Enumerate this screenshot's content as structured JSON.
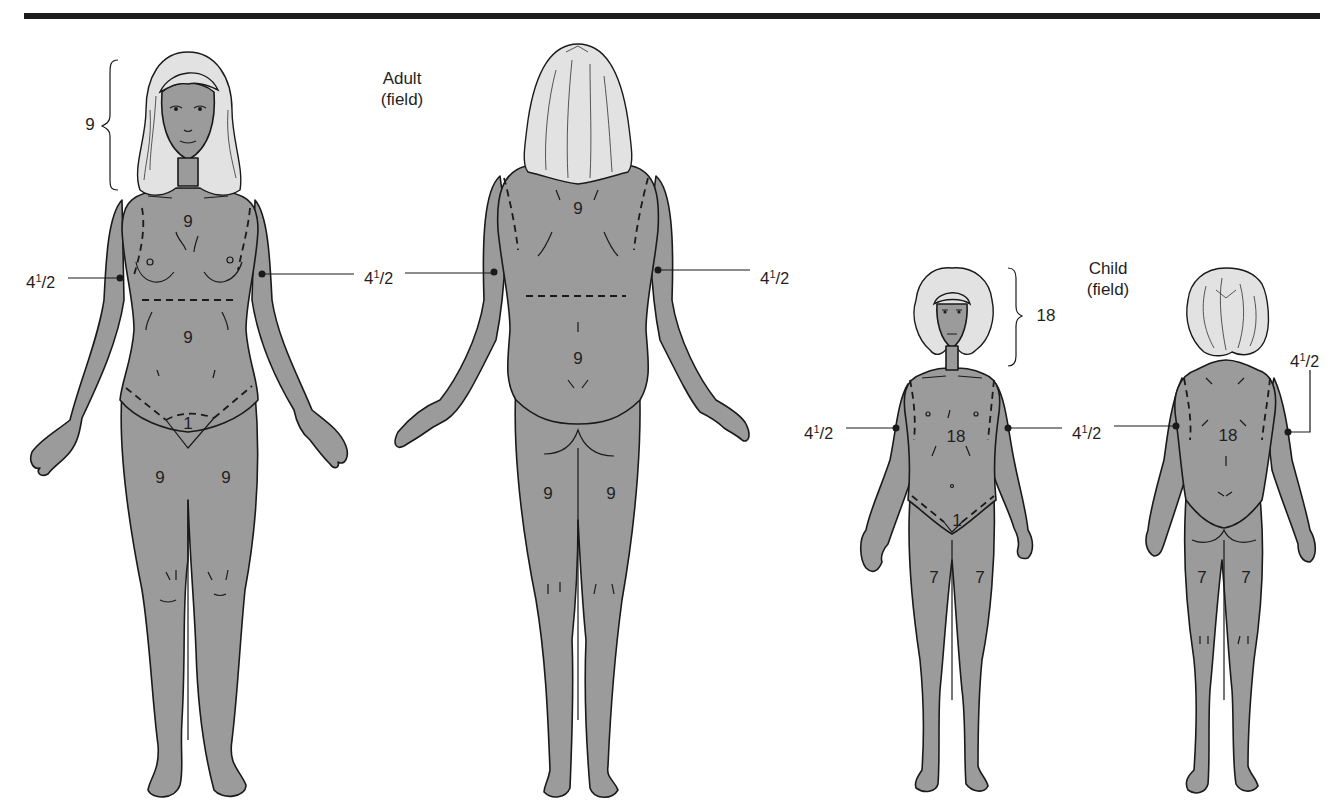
{
  "figure": {
    "colors": {
      "skin": "#9b9b9b",
      "hair": "#e2e2e2",
      "outline": "#1a1a1a",
      "bar": "#1c1c1c"
    },
    "adult": {
      "heading_line1": "Adult",
      "heading_line2": "(field)",
      "front": {
        "head": "9",
        "chest": "9",
        "abdomen": "9",
        "genitalia": "1",
        "left_leg": "9",
        "right_leg": "9",
        "left_arm": {
          "whole": "4",
          "num": "1",
          "den": "2"
        },
        "right_arm": {
          "whole": "4",
          "num": "1",
          "den": "2"
        }
      },
      "back": {
        "upper_back": "9",
        "lower_back": "9",
        "left_leg": "9",
        "right_leg": "9",
        "left_arm": {
          "whole": "4",
          "num": "1",
          "den": "2"
        },
        "right_arm": {
          "whole": "4",
          "num": "1",
          "den": "2"
        }
      }
    },
    "child": {
      "heading_line1": "Child",
      "heading_line2": "(field)",
      "front": {
        "head": "18",
        "trunk": "18",
        "genitalia": "1",
        "left_leg": "7",
        "right_leg": "7",
        "left_arm": {
          "whole": "4",
          "num": "1",
          "den": "2"
        },
        "right_arm": {
          "whole": "4",
          "num": "1",
          "den": "2"
        }
      },
      "back": {
        "trunk": "18",
        "left_leg": "7",
        "right_leg": "7",
        "left_arm": {
          "whole": "4",
          "num": "1",
          "den": "2"
        },
        "right_arm": {
          "whole": "4",
          "num": "1",
          "den": "2"
        }
      }
    }
  }
}
